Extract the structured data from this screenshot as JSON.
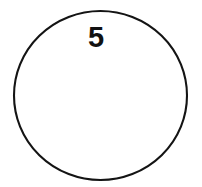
{
  "figure": {
    "kind": "geometry-circle-diagram",
    "background_color": "#ffffff",
    "width": 202,
    "height": 187,
    "shapes": [
      {
        "name": "circle",
        "type": "circle",
        "center_x": 100.5,
        "center_y": 95.5,
        "radius_x": 86.5,
        "radius_y": 84.5,
        "stroke_color": "#141414",
        "stroke_width": 2.1,
        "fill_color": "#ffffff"
      }
    ],
    "labels": [
      {
        "name": "circle-number-label",
        "text": "5",
        "x": 96,
        "y": 37,
        "font_size": 29,
        "color": "#111111",
        "weight": "bold"
      }
    ]
  }
}
